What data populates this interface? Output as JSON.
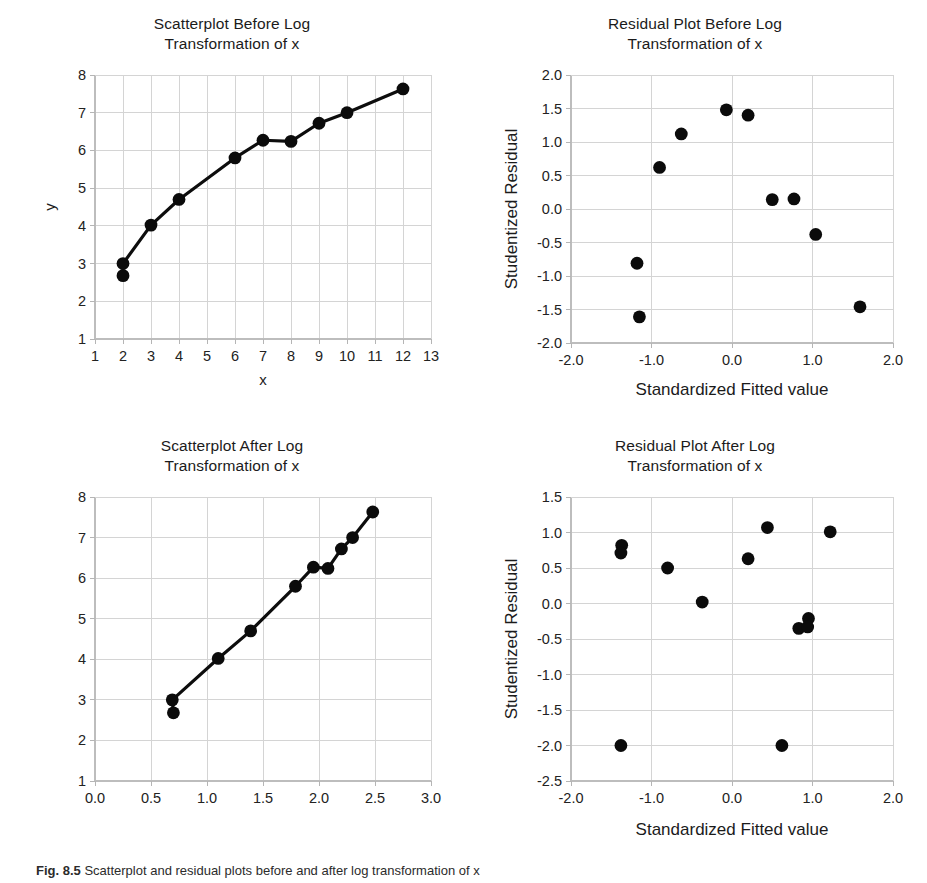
{
  "figure": {
    "caption_label": "Fig. 8.5",
    "caption_text": "Scatterplot and residual plots before and after log transformation of x"
  },
  "panels": [
    {
      "id": "scatter-before",
      "title": "Scatterplot Before Log\nTransformation of x",
      "xlabel": "x",
      "ylabel": "y"
    },
    {
      "id": "residual-before",
      "title": "Residual Plot Before Log\nTransformation of x",
      "xlabel": "Standardized Fitted value",
      "ylabel": "Studentized Residual"
    },
    {
      "id": "scatter-after",
      "title": "Scatterplot After Log\nTransformation of x",
      "xlabel": "",
      "ylabel": ""
    },
    {
      "id": "residual-after",
      "title": "Residual Plot After Log\nTransformation of x",
      "xlabel": "Standardized Fitted value",
      "ylabel": "Studentized Residual"
    }
  ],
  "chart_data": [
    {
      "type": "line",
      "id": "scatter-before",
      "title": "Scatterplot Before Log Transformation of x",
      "xlabel": "x",
      "ylabel": "y",
      "xlim": [
        1,
        13
      ],
      "ylim": [
        1,
        8
      ],
      "xticks": [
        1,
        2,
        3,
        4,
        5,
        6,
        7,
        8,
        9,
        10,
        11,
        12,
        13
      ],
      "yticks": [
        1,
        2,
        3,
        4,
        5,
        6,
        7,
        8
      ],
      "xticklabels": [
        "1",
        "2",
        "3",
        "4",
        "5",
        "6",
        "7",
        "8",
        "9",
        "10",
        "11",
        "12",
        "13"
      ],
      "yticklabels": [
        "1",
        "2",
        "3",
        "4",
        "5",
        "6",
        "7",
        "8"
      ],
      "grid": true,
      "markers": true,
      "line": true,
      "legend": "none",
      "points": [
        {
          "x": 2.0,
          "y": 3.0
        },
        {
          "x": 2.0,
          "y": 2.68
        },
        {
          "x": 3.0,
          "y": 4.02
        },
        {
          "x": 4.0,
          "y": 4.7
        },
        {
          "x": 6.0,
          "y": 5.8
        },
        {
          "x": 7.0,
          "y": 6.27
        },
        {
          "x": 8.0,
          "y": 6.24
        },
        {
          "x": 9.0,
          "y": 6.72
        },
        {
          "x": 10.0,
          "y": 7.0
        },
        {
          "x": 12.0,
          "y": 7.63
        }
      ],
      "line_order": [
        {
          "x": 2.0,
          "y": 2.68
        },
        {
          "x": 2.0,
          "y": 3.0
        },
        {
          "x": 3.0,
          "y": 4.02
        },
        {
          "x": 4.0,
          "y": 4.7
        },
        {
          "x": 6.0,
          "y": 5.8
        },
        {
          "x": 7.0,
          "y": 6.27
        },
        {
          "x": 8.0,
          "y": 6.24
        },
        {
          "x": 9.0,
          "y": 6.72
        },
        {
          "x": 10.0,
          "y": 7.0
        },
        {
          "x": 12.0,
          "y": 7.63
        }
      ]
    },
    {
      "type": "scatter",
      "id": "residual-before",
      "title": "Residual Plot Before Log Transformation of x",
      "xlabel": "Standardized Fitted value",
      "ylabel": "Studentized Residual",
      "xlim": [
        -2.0,
        2.0
      ],
      "ylim": [
        -2.0,
        2.0
      ],
      "xticks": [
        -2.0,
        -1.0,
        0.0,
        1.0,
        2.0
      ],
      "yticks": [
        -2.0,
        -1.5,
        -1.0,
        -0.5,
        0.0,
        0.5,
        1.0,
        1.5,
        2.0
      ],
      "xticklabels": [
        "-2.0",
        "-1.0",
        "0.0",
        "1.0",
        "2.0"
      ],
      "yticklabels": [
        "-2.0",
        "-1.5",
        "-1.0",
        "-0.5",
        "0.0",
        "0.5",
        "1.0",
        "1.5",
        "2.0"
      ],
      "grid": true,
      "markers": true,
      "line": false,
      "legend": "none",
      "points": [
        {
          "x": -1.18,
          "y": -0.81
        },
        {
          "x": -1.15,
          "y": -1.61
        },
        {
          "x": -0.9,
          "y": 0.62
        },
        {
          "x": -0.63,
          "y": 1.12
        },
        {
          "x": -0.07,
          "y": 1.48
        },
        {
          "x": 0.2,
          "y": 1.4
        },
        {
          "x": 0.5,
          "y": 0.14
        },
        {
          "x": 0.77,
          "y": 0.15
        },
        {
          "x": 1.04,
          "y": -0.38
        },
        {
          "x": 1.59,
          "y": -1.46
        }
      ]
    },
    {
      "type": "line",
      "id": "scatter-after",
      "title": "Scatterplot After Log Transformation of x",
      "xlabel": "",
      "ylabel": "",
      "xlim": [
        0.0,
        3.0
      ],
      "ylim": [
        1,
        8
      ],
      "xticks": [
        0.0,
        0.5,
        1.0,
        1.5,
        2.0,
        2.5,
        3.0
      ],
      "yticks": [
        1,
        2,
        3,
        4,
        5,
        6,
        7,
        8
      ],
      "xticklabels": [
        "0.0",
        "0.5",
        "1.0",
        "1.5",
        "2.0",
        "2.5",
        "3.0"
      ],
      "yticklabels": [
        "1",
        "2",
        "3",
        "4",
        "5",
        "6",
        "7",
        "8"
      ],
      "grid": true,
      "markers": true,
      "line": true,
      "legend": "none",
      "points": [
        {
          "x": 0.69,
          "y": 3.0
        },
        {
          "x": 0.7,
          "y": 2.68
        },
        {
          "x": 1.1,
          "y": 4.02
        },
        {
          "x": 1.39,
          "y": 4.7
        },
        {
          "x": 1.79,
          "y": 5.8
        },
        {
          "x": 1.95,
          "y": 6.27
        },
        {
          "x": 2.08,
          "y": 6.24
        },
        {
          "x": 2.2,
          "y": 6.72
        },
        {
          "x": 2.3,
          "y": 7.0
        },
        {
          "x": 2.48,
          "y": 7.63
        }
      ],
      "line_order": [
        {
          "x": 0.7,
          "y": 2.68
        },
        {
          "x": 0.69,
          "y": 3.0
        },
        {
          "x": 1.1,
          "y": 4.02
        },
        {
          "x": 1.39,
          "y": 4.7
        },
        {
          "x": 1.79,
          "y": 5.8
        },
        {
          "x": 1.95,
          "y": 6.27
        },
        {
          "x": 2.08,
          "y": 6.24
        },
        {
          "x": 2.2,
          "y": 6.72
        },
        {
          "x": 2.3,
          "y": 7.0
        },
        {
          "x": 2.48,
          "y": 7.63
        }
      ]
    },
    {
      "type": "scatter",
      "id": "residual-after",
      "title": "Residual Plot After Log Transformation of x",
      "xlabel": "Standardized Fitted value",
      "ylabel": "Studentized Residual",
      "xlim": [
        -2.0,
        2.0
      ],
      "ylim": [
        -2.5,
        1.5
      ],
      "xticks": [
        -2.0,
        -1.0,
        0.0,
        1.0,
        2.0
      ],
      "yticks": [
        -2.5,
        -2.0,
        -1.5,
        -1.0,
        -0.5,
        0.0,
        0.5,
        1.0,
        1.5
      ],
      "xticklabels": [
        "-2.0",
        "-1.0",
        "0.0",
        "1.0",
        "2.0"
      ],
      "yticklabels": [
        "-2.5",
        "-2.0",
        "-1.5",
        "-1.0",
        "-0.5",
        "0.0",
        "0.5",
        "1.0",
        "1.5"
      ],
      "grid": true,
      "markers": true,
      "line": false,
      "legend": "none",
      "points": [
        {
          "x": -1.37,
          "y": 0.82
        },
        {
          "x": -1.38,
          "y": 0.71
        },
        {
          "x": -1.38,
          "y": -2.0
        },
        {
          "x": -0.8,
          "y": 0.5
        },
        {
          "x": -0.37,
          "y": 0.02
        },
        {
          "x": 0.2,
          "y": 0.63
        },
        {
          "x": 0.44,
          "y": 1.07
        },
        {
          "x": 0.62,
          "y": -2.0
        },
        {
          "x": 0.83,
          "y": -0.35
        },
        {
          "x": 0.95,
          "y": -0.21
        },
        {
          "x": 0.94,
          "y": -0.33
        },
        {
          "x": 1.22,
          "y": 1.01
        }
      ]
    }
  ],
  "colors": {
    "marker": "#0b0b0b",
    "line": "#0d0d0d",
    "grid": "#d4d4d4",
    "axis": "#bdbdbd",
    "text": "#1b1b1b",
    "background": "#ffffff"
  }
}
